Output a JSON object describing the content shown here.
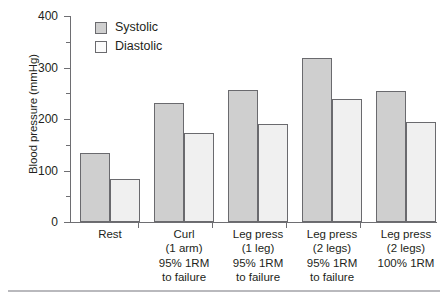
{
  "chart_data": {
    "type": "bar",
    "title": "",
    "xlabel": "",
    "ylabel": "Blood pressure (mmHg)",
    "ylim": [
      0,
      400
    ],
    "ytick_labels": [
      "0",
      "100",
      "200",
      "300",
      "400"
    ],
    "ytick_values": [
      0,
      100,
      200,
      300,
      400
    ],
    "yminor_values": [
      50,
      150,
      250,
      350
    ],
    "grid": false,
    "legend_position": "top-left-inside",
    "categories": [
      "Rest",
      "Curl (1 arm) 95% 1RM to failure",
      "Leg press (1 leg) 95% 1RM to failure",
      "Leg press (2 legs) 95% 1RM to failure",
      "Leg press (2 legs) 100% 1RM"
    ],
    "category_lines": [
      [
        "Rest"
      ],
      [
        "Curl",
        "(1 arm)",
        "95% 1RM",
        "to failure"
      ],
      [
        "Leg press",
        "(1 leg)",
        "95% 1RM",
        "to failure"
      ],
      [
        "Leg press",
        "(2 legs)",
        "95% 1RM",
        "to failure"
      ],
      [
        "Leg press",
        "(2 legs)",
        "100% 1RM"
      ]
    ],
    "series": [
      {
        "name": "Systolic",
        "color": "#cfcfcf",
        "values": [
          134,
          231,
          256,
          318,
          255
        ]
      },
      {
        "name": "Diastolic",
        "color": "#f0f0f0",
        "values": [
          84,
          172,
          191,
          239,
          194
        ]
      }
    ]
  },
  "legend": {
    "items": [
      {
        "label": "Systolic",
        "swatch": "gray-filled-square"
      },
      {
        "label": "Diastolic",
        "swatch": "white-filled-square"
      }
    ]
  },
  "axis": {
    "y_title": "Blood pressure (mmHg)",
    "y_ticks": [
      "400",
      "300",
      "200",
      "100",
      "0"
    ]
  },
  "colors": {
    "systolic_fill": "#cfcfcf",
    "diastolic_fill": "#f0f0f0",
    "bar_stroke": "#6a6a6e",
    "axis": "#6e6e72",
    "text": "#231f20",
    "rule": "#b9b9bd"
  }
}
